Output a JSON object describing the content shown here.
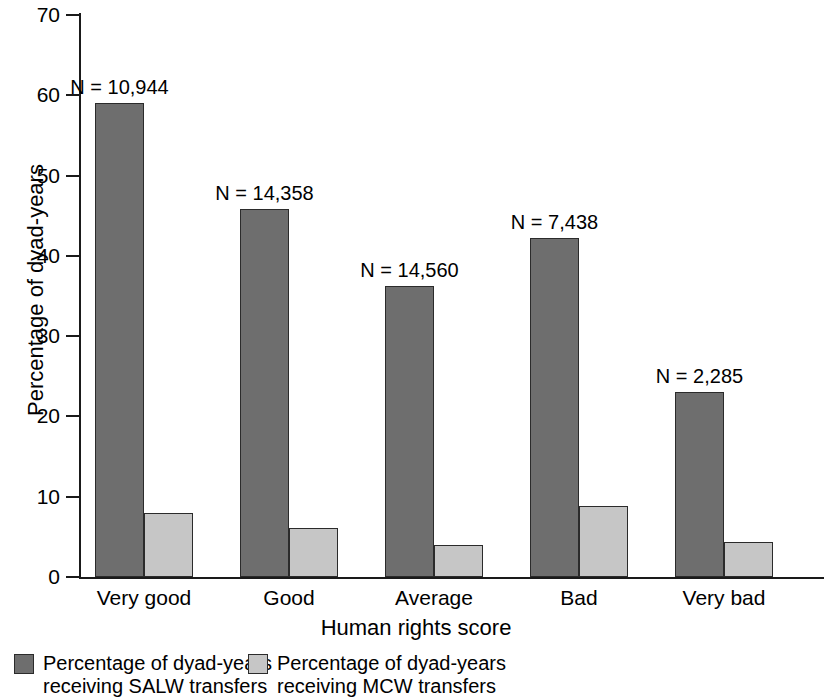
{
  "chart_data": {
    "type": "bar",
    "title": "",
    "xlabel": "Human rights score",
    "ylabel": "Percentage of dyad-years",
    "categories": [
      "Very good",
      "Good",
      "Average",
      "Bad",
      "Very bad"
    ],
    "ylim": [
      0,
      70
    ],
    "y_ticks": [
      0,
      10,
      20,
      30,
      40,
      50,
      60,
      70
    ],
    "grid": false,
    "legend_position": "below-plot",
    "series": [
      {
        "name": "Percentage of dyad-years\nreceiving SALW transfers",
        "key": "salw",
        "color": "#6e6e6e",
        "values": [
          59.0,
          45.8,
          36.2,
          42.2,
          23.0
        ]
      },
      {
        "name": "Percentage of dyad-years\nreceiving MCW transfers",
        "key": "mcw",
        "color": "#c6c6c6",
        "values": [
          8.0,
          6.1,
          4.0,
          8.8,
          4.3
        ]
      }
    ],
    "annotations": [
      {
        "text": "N = 10,944",
        "category": "Very good",
        "n": 10944
      },
      {
        "text": "N = 14,358",
        "category": "Good",
        "n": 14358
      },
      {
        "text": "N = 14,560",
        "category": "Average",
        "n": 14560
      },
      {
        "text": "N = 7,438",
        "category": "Bad",
        "n": 7438
      },
      {
        "text": "N = 2,285",
        "category": "Very bad",
        "n": 2285
      }
    ],
    "tick_labels": [
      "70",
      "60",
      "50",
      "40",
      "30",
      "20",
      "10",
      "0"
    ]
  },
  "legend": {
    "items": [
      {
        "label": "Percentage of dyad-years\nreceiving SALW transfers",
        "swatch": "salw"
      },
      {
        "label": "Percentage of dyad-years\nreceiving MCW transfers",
        "swatch": "mcw"
      }
    ]
  }
}
